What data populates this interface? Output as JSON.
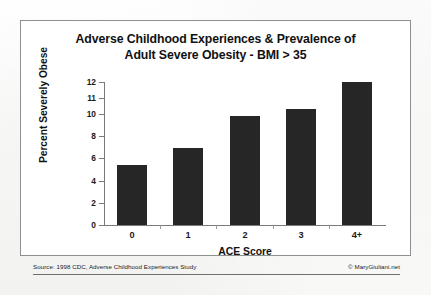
{
  "chart_data": {
    "type": "bar",
    "title": "Adverse Childhood Experiences & Prevalence of Adult Severe Obesity - BMI > 35",
    "title_line1": "Adverse Childhood Experiences & Prevalence of",
    "title_line2": "Adult Severe Obesity - BMI > 35",
    "xlabel": "ACE Score",
    "ylabel": "Percent Severely Obese",
    "categories": [
      "0",
      "1",
      "2",
      "3",
      "4+"
    ],
    "values": [
      5.4,
      6.9,
      9.8,
      10.3,
      12.0
    ],
    "ylim": [
      0,
      12
    ],
    "yticks": [
      0,
      2,
      4,
      6,
      8,
      10,
      11,
      12
    ],
    "ytick_labels": [
      "0",
      "2",
      "4",
      "6",
      "8",
      "10",
      "11",
      "12"
    ],
    "grid": false,
    "legend": null,
    "bar_color": "#262626",
    "axis_color": "#7a7a7a",
    "note": "y-axis tick spacing is non-uniform: 2-unit steps from 0 to 10, then 1-unit steps for 11 and 12"
  },
  "footer": {
    "source": "Source: 1998 CDC, Adverse Childhood Experiences Study",
    "copyright": "© MaryGiuliani.net"
  }
}
